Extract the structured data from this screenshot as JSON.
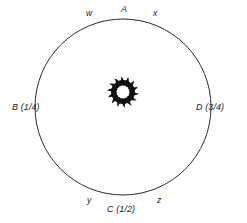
{
  "figure": {
    "type": "circle-diagram",
    "background_color": "#ffffff",
    "stroke_color": "#2b2b2b",
    "ornament_color": "#111111",
    "circle": {
      "center_x": 123,
      "center_y": 107,
      "radius": 88,
      "stroke_width": 1
    },
    "ornament": {
      "name": "swirl-sunburst",
      "center_x": 123,
      "center_y": 92,
      "outer_radius": 15,
      "inner_radius": 6,
      "teeth": 14
    },
    "point_labels": [
      {
        "id": "A",
        "text": "A",
        "position": "top",
        "value": "0"
      },
      {
        "id": "B",
        "text": "B (1/4)",
        "position": "left",
        "value": "1/4"
      },
      {
        "id": "C",
        "text": "C (1/2)",
        "position": "bottom",
        "value": "1/2"
      },
      {
        "id": "D",
        "text": "D (3/4)",
        "position": "right",
        "value": "3/4"
      }
    ],
    "arc_labels": [
      {
        "id": "w",
        "text": "w",
        "position": "top-left"
      },
      {
        "id": "x",
        "text": "x",
        "position": "top-right"
      },
      {
        "id": "y",
        "text": "y",
        "position": "bottom-left"
      },
      {
        "id": "z",
        "text": "z",
        "position": "bottom-right"
      }
    ]
  }
}
